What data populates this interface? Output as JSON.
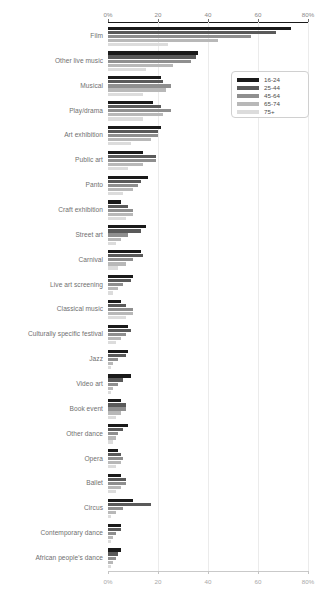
{
  "chart_data": {
    "type": "bar",
    "orientation": "horizontal",
    "title": "",
    "subtitle": "",
    "xlabel": "",
    "ylabel": "",
    "xlim": [
      0,
      80
    ],
    "grid": true,
    "legend_position": "top-right",
    "axis_ticks": [
      {
        "value": 0,
        "label": "0%"
      },
      {
        "value": 20,
        "label": "20"
      },
      {
        "value": 40,
        "label": "40"
      },
      {
        "value": 60,
        "label": "60"
      },
      {
        "value": 80,
        "label": "80%"
      }
    ],
    "categories": [
      "Film",
      "Other live music",
      "Musical",
      "Play/drama",
      "Art exhibition",
      "Public art",
      "Panto",
      "Craft exhibition",
      "Street art",
      "Carnival",
      "Live art screening",
      "Classical music",
      "Culturally specific festival",
      "Jazz",
      "Video art",
      "Book event",
      "Other dance",
      "Opera",
      "Ballet",
      "Circus",
      "Contemporary dance",
      "African people's dance"
    ],
    "series": [
      {
        "name": "16-24",
        "color": "#1a1a1a",
        "values": [
          73,
          36,
          21,
          18,
          21,
          14,
          16,
          5,
          15,
          13,
          10,
          5,
          8,
          8,
          9,
          5,
          8,
          4,
          5,
          10,
          5,
          5
        ]
      },
      {
        "name": "25-44",
        "color": "#5a5a5a",
        "values": [
          67,
          35,
          22,
          21,
          20,
          19,
          13,
          8,
          13,
          14,
          9,
          7,
          9,
          7,
          6,
          7,
          6,
          5,
          7,
          17,
          5,
          4
        ]
      },
      {
        "name": "45-64",
        "color": "#8f8f8f",
        "values": [
          57,
          33,
          25,
          25,
          20,
          19,
          12,
          10,
          8,
          10,
          6,
          10,
          7,
          4,
          4,
          7,
          4,
          6,
          7,
          6,
          3,
          3
        ]
      },
      {
        "name": "65-74",
        "color": "#b8b8b8",
        "values": [
          44,
          26,
          23,
          22,
          17,
          14,
          10,
          10,
          5,
          7,
          4,
          10,
          5,
          2,
          2,
          5,
          3,
          5,
          5,
          3,
          2,
          2
        ]
      },
      {
        "name": "75+",
        "color": "#dcdcdc",
        "values": [
          24,
          15,
          14,
          14,
          9,
          8,
          6,
          7,
          3,
          4,
          2,
          7,
          3,
          1,
          1,
          3,
          2,
          3,
          3,
          1,
          1,
          1
        ]
      }
    ]
  },
  "legend": {
    "entries": [
      "16-24",
      "25-44",
      "45-64",
      "65-74",
      "75+"
    ]
  }
}
